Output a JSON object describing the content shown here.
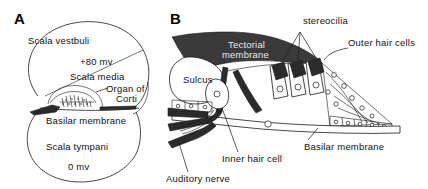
{
  "figure": {
    "background_color": "#ffffff",
    "ink_color": "#1a1a1a",
    "dark_fill_color": "#3a3a3a",
    "width": 428,
    "height": 189
  },
  "panels": [
    {
      "letter": "A",
      "name": "cochlear-cross-section",
      "labels": [
        {
          "id": "scala-vestibuli",
          "text": "Scala vestbuli"
        },
        {
          "id": "potential-plus80",
          "text": "+80 mv"
        },
        {
          "id": "scala-media",
          "text": "Scala media"
        },
        {
          "id": "organ-of-corti-line1",
          "text": "Organ of"
        },
        {
          "id": "organ-of-corti-line2",
          "text": "Corti"
        },
        {
          "id": "basilar-membrane",
          "text": "Basilar membrane"
        },
        {
          "id": "scala-tympani",
          "text": "Scala tympani"
        },
        {
          "id": "potential-zero",
          "text": "0 mv"
        }
      ]
    },
    {
      "letter": "B",
      "name": "organ-of-corti-detail",
      "labels": [
        {
          "id": "stereocilia",
          "text": "stereocilia"
        },
        {
          "id": "outer-hair-cells",
          "text": "Outer hair cells"
        },
        {
          "id": "tectorial-membrane-line1",
          "text": "Tectorial"
        },
        {
          "id": "tectorial-membrane-line2",
          "text": "membrane"
        },
        {
          "id": "sulcus",
          "text": "Sulcus"
        },
        {
          "id": "basilar-membrane",
          "text": "Basilar membrane"
        },
        {
          "id": "inner-hair-cell",
          "text": "Inner hair cell"
        },
        {
          "id": "auditory-nerve",
          "text": "Auditory nerve"
        }
      ]
    }
  ]
}
